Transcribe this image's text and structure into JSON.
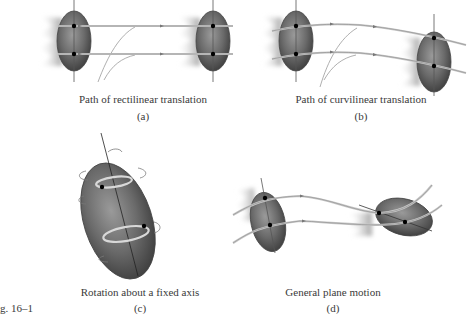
{
  "figure_label": "g. 16–1",
  "panels": [
    {
      "id": "a",
      "caption": "Path of rectilinear translation",
      "label": "(a)"
    },
    {
      "id": "b",
      "caption": "Path of curvilinear translation",
      "label": "(b)"
    },
    {
      "id": "c",
      "caption": "Rotation about a fixed axis",
      "label": "(c)"
    },
    {
      "id": "d",
      "caption": "General plane motion",
      "label": "(d)"
    }
  ],
  "colors": {
    "body_dark": "#3c3c3c",
    "body_light": "#8a8a8a",
    "path_line": "#8c8c8c",
    "caption_text": "#3a3a3a"
  }
}
